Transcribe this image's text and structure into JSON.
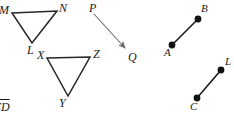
{
  "figure": {
    "type": "geometry-diagram",
    "background_color": "#ffffff",
    "stroke_color": "#262626",
    "arrow_color": "#6b6b6b",
    "width": 234,
    "height": 115,
    "shapes": [
      {
        "name": "triangle-MNL",
        "kind": "triangle",
        "vertices": [
          {
            "label": "M",
            "x": 12,
            "y": 13
          },
          {
            "label": "N",
            "x": 57,
            "y": 11
          },
          {
            "label": "L",
            "x": 32,
            "y": 43
          }
        ]
      },
      {
        "name": "triangle-XZY",
        "kind": "triangle",
        "vertices": [
          {
            "label": "X",
            "x": 47,
            "y": 58
          },
          {
            "label": "Z",
            "x": 90,
            "y": 57
          },
          {
            "label": "Y",
            "x": 68,
            "y": 96
          }
        ]
      },
      {
        "name": "ray-PQ",
        "kind": "arrow",
        "from": {
          "label": "P",
          "x": 94,
          "y": 14
        },
        "to": {
          "label": "Q",
          "x": 127,
          "y": 50
        }
      },
      {
        "name": "segment-AB",
        "kind": "segment-with-endpoints",
        "from": {
          "label": "A",
          "x": 172,
          "y": 45
        },
        "to": {
          "label": "B",
          "x": 198,
          "y": 19
        }
      },
      {
        "name": "segment-CL",
        "kind": "segment-with-endpoints",
        "from": {
          "label": "C",
          "x": 197,
          "y": 98
        },
        "to": {
          "label": "L",
          "x": 221,
          "y": 70
        }
      }
    ],
    "labels": {
      "M": "M",
      "N": "N",
      "L1": "L",
      "X": "X",
      "Z": "Z",
      "Y": "Y",
      "P": "P",
      "Q": "Q",
      "A": "A",
      "B": "B",
      "C": "C",
      "L2": "L",
      "clipped_bottom_left": "CD"
    }
  }
}
